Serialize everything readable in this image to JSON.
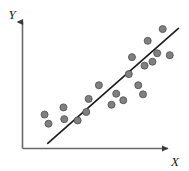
{
  "chart_data": {
    "type": "scatter",
    "title": "",
    "xlabel": "X",
    "ylabel": "Y",
    "xlim": [
      0,
      100
    ],
    "ylim": [
      0,
      100
    ],
    "grid": false,
    "legend": null,
    "annotations": [],
    "series": [
      {
        "name": "observations",
        "marker": "circle",
        "color": "#808080",
        "edge_color": "#55555a",
        "marker_size": 7,
        "points": [
          {
            "x": 14.0,
            "y": 26.0
          },
          {
            "x": 16.5,
            "y": 19.0
          },
          {
            "x": 26.0,
            "y": 31.5
          },
          {
            "x": 26.5,
            "y": 22.5
          },
          {
            "x": 35.0,
            "y": 21.5
          },
          {
            "x": 40.5,
            "y": 28.0
          },
          {
            "x": 42.0,
            "y": 38.0
          },
          {
            "x": 48.5,
            "y": 48.5
          },
          {
            "x": 56.5,
            "y": 33.5
          },
          {
            "x": 59.5,
            "y": 42.0
          },
          {
            "x": 64.0,
            "y": 37.0
          },
          {
            "x": 67.5,
            "y": 57.0
          },
          {
            "x": 69.5,
            "y": 70.0
          },
          {
            "x": 73.5,
            "y": 48.5
          },
          {
            "x": 76.5,
            "y": 41.5
          },
          {
            "x": 77.5,
            "y": 63.5
          },
          {
            "x": 79.5,
            "y": 82.5
          },
          {
            "x": 82.5,
            "y": 66.5
          },
          {
            "x": 85.5,
            "y": 73.0
          },
          {
            "x": 89.0,
            "y": 91.5
          },
          {
            "x": 93.5,
            "y": 71.5
          }
        ]
      }
    ],
    "trendline": {
      "name": "regression-line",
      "color": "#1a1a1a",
      "width": 1.6,
      "x_start": 16.0,
      "y_start": 4.0,
      "x_end": 99.0,
      "y_end": 92.0
    },
    "axes": {
      "style": "L-shaped-with-arrows",
      "color": "#555558",
      "x_axis_label": "X",
      "y_axis_label": "Y",
      "arrowheads": true
    }
  }
}
